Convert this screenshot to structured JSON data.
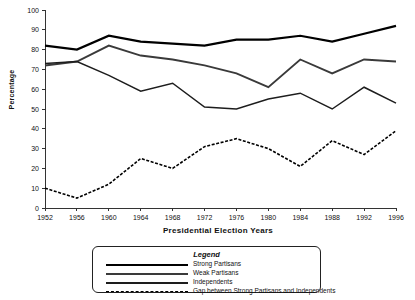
{
  "chart_data": {
    "type": "line",
    "title": "",
    "xlabel": "Presidential Election Years",
    "ylabel": "Percentage",
    "categories": [
      "1952",
      "1956",
      "1960",
      "1964",
      "1968",
      "1972",
      "1976",
      "1980",
      "1984",
      "1988",
      "1992",
      "1996"
    ],
    "x": [
      1952,
      1956,
      1960,
      1964,
      1968,
      1972,
      1976,
      1980,
      1984,
      1988,
      1992,
      1996
    ],
    "ylim": [
      0,
      100
    ],
    "yticks": [
      0,
      10,
      20,
      30,
      40,
      50,
      60,
      70,
      80,
      90,
      100
    ],
    "grid": false,
    "legend_position": "below-plot",
    "series": [
      {
        "name": "Strong Partisans",
        "values": [
          82,
          80,
          87,
          84,
          83,
          82,
          85,
          85,
          87,
          84,
          88,
          92
        ],
        "color": "#000000",
        "width": 2.2,
        "dash": "none"
      },
      {
        "name": "Weak Partisans",
        "values": [
          72,
          74,
          82,
          77,
          75,
          72,
          68,
          61,
          75,
          68,
          75,
          74
        ],
        "color": "#3a3a3a",
        "width": 1.9,
        "dash": "none"
      },
      {
        "name": "Independents",
        "values": [
          73,
          74,
          67,
          59,
          63,
          51,
          50,
          55,
          58,
          50,
          61,
          53
        ],
        "color": "#1d1d1d",
        "width": 1.5,
        "dash": "none"
      },
      {
        "name": "Gap between Strong Partisans and Independents",
        "values": [
          10,
          5,
          12,
          25,
          20,
          31,
          35,
          30,
          21,
          34,
          27,
          39
        ],
        "color": "#000000",
        "width": 1.6,
        "dash": "3,1.6"
      }
    ]
  },
  "legend": {
    "title": "Legend",
    "items": [
      {
        "label": "Strong Partisans"
      },
      {
        "label": "Weak Partisans"
      },
      {
        "label": "Independents"
      },
      {
        "label": "Gap between Strong Partisans and Independents"
      }
    ]
  },
  "axes": {
    "y_title": "Percentage",
    "x_title": "Presidential Election Years"
  }
}
